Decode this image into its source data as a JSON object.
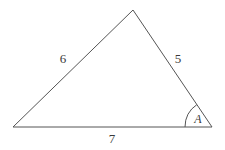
{
  "figure": {
    "kind": "triangle-diagram",
    "background_color": "#ffffff",
    "stroke_color": "#555555",
    "text_color": "#3a3a3a",
    "stroke_width": 1,
    "width": 225,
    "height": 150
  },
  "vertices": {
    "left": {
      "name": "left-vertex",
      "x": 13,
      "y": 127
    },
    "apex": {
      "name": "apex-vertex",
      "x": 133,
      "y": 10
    },
    "right": {
      "name": "right-vertex",
      "x": 212,
      "y": 127
    }
  },
  "sides": [
    {
      "id": "left-side",
      "label": "6",
      "label_x": 63,
      "label_y": 58,
      "from": "left",
      "to": "apex"
    },
    {
      "id": "right-side",
      "label": "5",
      "label_x": 178,
      "label_y": 58,
      "from": "apex",
      "to": "right"
    },
    {
      "id": "base-side",
      "label": "7",
      "label_x": 112,
      "label_y": 138,
      "from": "left",
      "to": "right"
    }
  ],
  "angles": [
    {
      "id": "angle-A",
      "label": "A",
      "at_vertex": "right",
      "label_x": 198,
      "label_y": 119,
      "arc_radius": 27
    }
  ],
  "chart_data": {
    "type": "diagram",
    "title": "",
    "shape": "triangle",
    "side_lengths": [
      6,
      5,
      7
    ],
    "side_label_texts": [
      "6",
      "5",
      "7"
    ],
    "angle_label_texts": [
      "A"
    ]
  }
}
